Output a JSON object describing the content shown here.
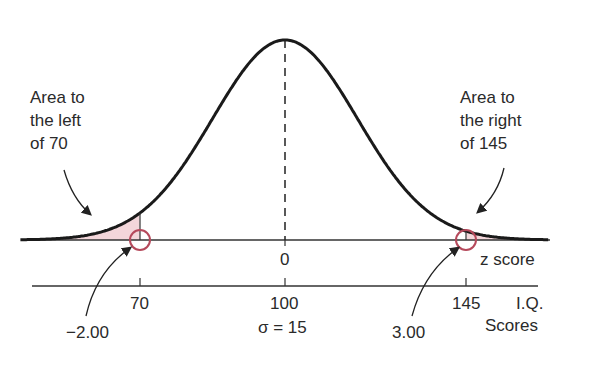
{
  "chart_data": {
    "type": "area",
    "title": "",
    "distribution": "normal",
    "mean": 100,
    "sigma": 15,
    "sigma_label": "σ = 15",
    "z_axis": {
      "label": "z score",
      "ticks": [
        {
          "value": 0,
          "label": "0"
        }
      ]
    },
    "iq_axis": {
      "label_line1": "I.Q.",
      "label_line2": "Scores",
      "ticks": [
        {
          "value": 70,
          "label": "70"
        },
        {
          "value": 100,
          "label": "100"
        },
        {
          "value": 145,
          "label": "145"
        }
      ]
    },
    "shaded_regions": [
      {
        "name": "left tail",
        "from": "-inf",
        "to": 70,
        "z": -2.0
      },
      {
        "name": "right tail",
        "from": 145,
        "to": "inf",
        "z": 3.0
      }
    ],
    "annotations": [
      {
        "text": "Area to the left of 70"
      },
      {
        "text": "Area to the right of 145"
      },
      {
        "text": "-2.00"
      },
      {
        "text": "3.00"
      }
    ],
    "colors": {
      "curve": "#1a1a1a",
      "shade": "#f3d6da",
      "circle": "#b5495b"
    }
  },
  "labels": {
    "left_note": [
      "Area to",
      "the left",
      "of 70"
    ],
    "right_note": [
      "Area to",
      "the right",
      "of 145"
    ],
    "z_zero": "0",
    "z_axis_label": "z score",
    "iq_70": "70",
    "iq_100": "100",
    "iq_145": "145",
    "iq_label_1": "I.Q.",
    "iq_label_2": "Scores",
    "sigma": "σ = 15",
    "z_left": "−2.00",
    "z_right": "3.00"
  }
}
